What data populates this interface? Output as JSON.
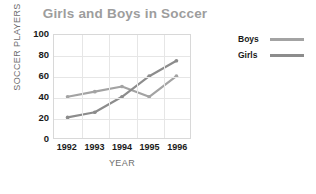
{
  "chart_data": {
    "type": "line",
    "title": "Girls and Boys in Soccer",
    "xlabel": "YEAR",
    "ylabel": "SOCCER PLAYERS",
    "categories": [
      "1992",
      "1993",
      "1994",
      "1995",
      "1996"
    ],
    "x": [
      1992,
      1993,
      1994,
      1995,
      1996
    ],
    "ylim": [
      0,
      100
    ],
    "yticks": [
      "0",
      "20",
      "40",
      "60",
      "80",
      "100"
    ],
    "ytick_values": [
      0,
      20,
      40,
      60,
      80,
      100
    ],
    "grid": true,
    "legend_position": "right",
    "series": [
      {
        "name": "Boys",
        "values": [
          40,
          45,
          50,
          40,
          60
        ],
        "color": "#a3a3a3"
      },
      {
        "name": "Girls",
        "values": [
          20,
          25,
          40,
          60,
          75
        ],
        "color": "#8c8c8c"
      }
    ]
  },
  "style": {
    "title_color": "#9d9d9d",
    "grid_color": "#e6e6e6",
    "frame_color": "#d8d8d8",
    "tick_color": "#1a1a1a",
    "axis_title_color": "#6e6e6e",
    "background": "#ffffff"
  }
}
